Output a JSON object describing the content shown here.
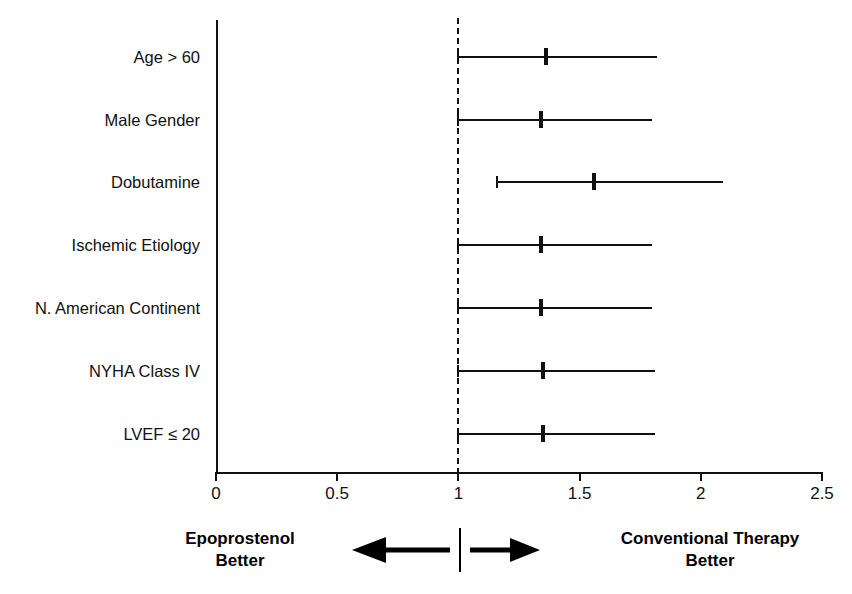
{
  "chart_data": {
    "type": "scatter",
    "subtype": "forest-plot",
    "title": "",
    "xlabel": "",
    "ylabel": "",
    "xlim": [
      0,
      2.5
    ],
    "xticks": [
      0,
      0.5,
      1,
      1.5,
      2,
      2.5
    ],
    "xtick_labels": [
      "0",
      "0.5",
      "1",
      "1.5",
      "2",
      "2.5"
    ],
    "grid": false,
    "reference_line": {
      "value": 1,
      "style": "dashed"
    },
    "categories": [
      "Age > 60",
      "Male Gender",
      "Dobutamine",
      "Ischemic Etiology",
      "N. American Continent",
      "NYHA Class IV",
      "LVEF ≤ 20"
    ],
    "values": [
      1.36,
      1.34,
      1.56,
      1.34,
      1.34,
      1.35,
      1.35
    ],
    "ci_lower": [
      1.0,
      1.0,
      1.16,
      1.0,
      1.0,
      1.0,
      1.0
    ],
    "ci_upper": [
      1.82,
      1.8,
      2.09,
      1.8,
      1.8,
      1.81,
      1.81
    ],
    "rows": [
      {
        "label": "Age > 60",
        "estimate": 1.36,
        "lower": 1.0,
        "upper": 1.82
      },
      {
        "label": "Male Gender",
        "estimate": 1.34,
        "lower": 1.0,
        "upper": 1.8
      },
      {
        "label": "Dobutamine",
        "estimate": 1.56,
        "lower": 1.16,
        "upper": 2.09
      },
      {
        "label": "Ischemic Etiology",
        "estimate": 1.34,
        "lower": 1.0,
        "upper": 1.8
      },
      {
        "label": "N. American Continent",
        "estimate": 1.34,
        "lower": 1.0,
        "upper": 1.8
      },
      {
        "label": "NYHA Class IV",
        "estimate": 1.35,
        "lower": 1.0,
        "upper": 1.81
      },
      {
        "label": "LVEF ≤ 20",
        "estimate": 1.35,
        "lower": 1.0,
        "upper": 1.81
      }
    ],
    "annotations": {
      "left_label_line1": "Epoprostenol",
      "left_label_line2": "Better",
      "right_label_line1": "Conventional Therapy",
      "right_label_line2": "Better"
    },
    "colors": {
      "ink": "#111111",
      "background": "#ffffff"
    }
  },
  "axis": {
    "ticks": [
      {
        "label": "0"
      },
      {
        "label": "0.5"
      },
      {
        "label": "1"
      },
      {
        "label": "1.5"
      },
      {
        "label": "2"
      },
      {
        "label": "2.5"
      }
    ]
  },
  "rows": [
    {
      "label": "Age > 60"
    },
    {
      "label": "Male Gender"
    },
    {
      "label": "Dobutamine"
    },
    {
      "label": "Ischemic Etiology"
    },
    {
      "label": "N. American Continent"
    },
    {
      "label": "NYHA Class IV"
    },
    {
      "label": "LVEF ≤ 20"
    }
  ],
  "legend": {
    "left_line1": "Epoprostenol",
    "left_line2": "Better",
    "right_line1": "Conventional Therapy",
    "right_line2": "Better"
  }
}
